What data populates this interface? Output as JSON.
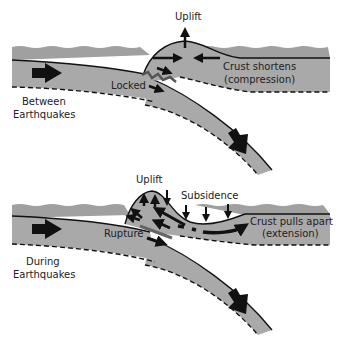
{
  "colors": {
    "plate_fill": "#a9a9a9",
    "ocean_fill": "#a0a0a0",
    "line": "#111111",
    "background": "#ffffff",
    "fault_gray": "#6a6a6a"
  },
  "panels": [
    {
      "name": "between-earthquakes",
      "caption_line1": "Between",
      "caption_line2": "Earthquakes",
      "labels": {
        "uplift": "Uplift",
        "locked": "Locked",
        "crust_line1": "Crust shortens",
        "crust_line2": "(compression)"
      }
    },
    {
      "name": "during-earthquakes",
      "caption_line1": "During",
      "caption_line2": "Earthquakes",
      "labels": {
        "uplift": "Uplift",
        "subsidence": "Subsidence",
        "rupture": "Rupture",
        "crust_line1": "Crust pulls apart",
        "crust_line2": "(extension)"
      }
    }
  ]
}
